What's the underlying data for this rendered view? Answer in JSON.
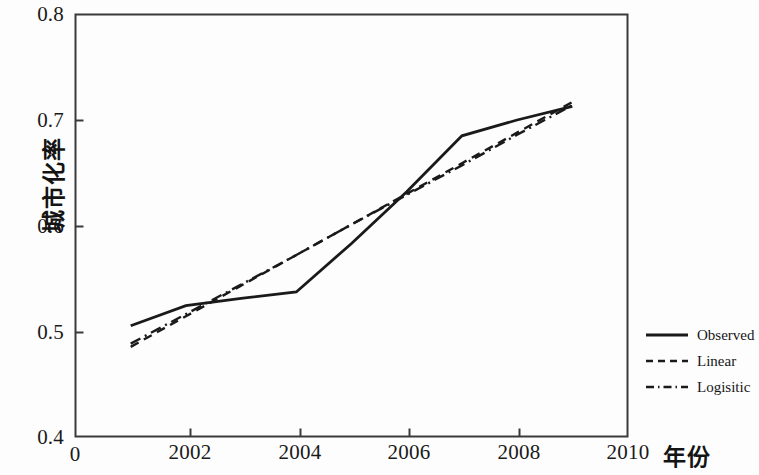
{
  "chart_data": {
    "type": "line",
    "title": "",
    "xlabel": "年份",
    "ylabel": "城市化率",
    "xlim": [
      2000,
      2010
    ],
    "ylim": [
      0.4,
      0.8
    ],
    "grid": false,
    "legend_position": "right",
    "x_ticks": [
      "0",
      "2002",
      "2004",
      "2006",
      "2008",
      "2010"
    ],
    "x_tick_values": [
      2000,
      2002,
      2004,
      2006,
      2008,
      2010
    ],
    "y_ticks": [
      "0.4",
      "0.5",
      "0.6",
      "0.7",
      "0.8"
    ],
    "y_tick_values": [
      0.4,
      0.5,
      0.6,
      0.7,
      0.8
    ],
    "x": [
      2001,
      2002,
      2003,
      2004,
      2005,
      2006,
      2007,
      2008,
      2009
    ],
    "series": [
      {
        "name": "Observed",
        "style": "solid",
        "color": "#1a1a1a",
        "values": [
          0.505,
          0.524,
          0.531,
          0.537,
          0.583,
          0.632,
          0.685,
          0.7,
          0.713
        ]
      },
      {
        "name": "Linear",
        "style": "dashed",
        "color": "#1a1a1a",
        "values": [
          0.485,
          0.514,
          0.543,
          0.572,
          0.601,
          0.63,
          0.659,
          0.688,
          0.717
        ]
      },
      {
        "name": "Logisitic",
        "style": "dashdot",
        "color": "#1a1a1a",
        "values": [
          0.488,
          0.516,
          0.544,
          0.572,
          0.601,
          0.629,
          0.657,
          0.686,
          0.714
        ]
      }
    ]
  },
  "legend": {
    "items": [
      {
        "label": "Observed",
        "style": "solid"
      },
      {
        "label": "Linear",
        "style": "dashed"
      },
      {
        "label": "Logisitic",
        "style": "dashdot"
      }
    ]
  },
  "axes": {
    "y_title": "城市化率",
    "x_title": "年份",
    "y_tick_labels": [
      "0.8",
      "0.7",
      "0.6",
      "0.5",
      "0.4"
    ],
    "x_tick_labels": [
      "0",
      "2002",
      "2004",
      "2006",
      "2008",
      "2010"
    ]
  },
  "colors": {
    "line": "#1a1a1a",
    "frame": "#3a3a3a",
    "background": "#fdfdfd"
  }
}
